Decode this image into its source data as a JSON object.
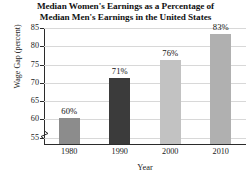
{
  "chart_data": {
    "type": "bar",
    "title": "Median Women's Earnings as a Percentage of Median Men's Earnings in the United States",
    "title_lines": [
      "Median Women's Earnings as a Percentage of",
      "Median Men's Earnings in the United States"
    ],
    "xlabel": "Year",
    "ylabel": "Wage Gap (percent)",
    "categories": [
      "1980",
      "1990",
      "2000",
      "2010"
    ],
    "values": [
      60,
      71,
      76,
      83
    ],
    "value_labels": [
      "60%",
      "71%",
      "76%",
      "83%"
    ],
    "bar_colors": [
      "#8c8c8c",
      "#3b3b3b",
      "#c2c2c2",
      "#b0b0b0"
    ],
    "ylim": [
      53,
      85
    ],
    "yticks": [
      55,
      60,
      65,
      70,
      75,
      80,
      85
    ],
    "ytick_labels": [
      "55",
      "60",
      "65",
      "70",
      "75",
      "80",
      "85"
    ],
    "grid": true,
    "legend": "none",
    "axis_break": true,
    "axis_color": "#2b2b2b",
    "grid_color": "#d8d8d8"
  }
}
